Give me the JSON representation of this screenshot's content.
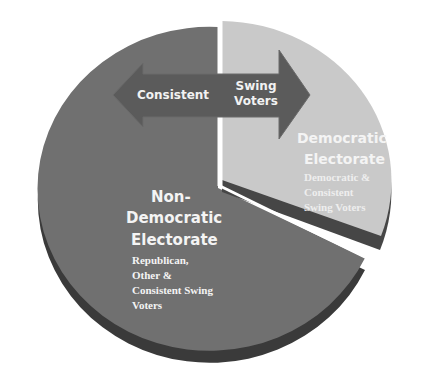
{
  "diagram": {
    "type": "exploded-pie-3d",
    "colors": {
      "non_democratic_face": "#6f6f6f",
      "non_democratic_rim": "#3a3a3a",
      "democratic_face": "#c8c8c8",
      "democratic_rim": "#464646",
      "arrow_fill": "#5a5a5a",
      "label_text": "#f4f4f4",
      "background": "#ffffff"
    },
    "arrow": {
      "left_label": "Consistent",
      "right_label_line1": "Swing",
      "right_label_line2": "Voters"
    },
    "segments": [
      {
        "id": "non-democratic",
        "title_line1": "Non-",
        "title_line2": "Democratic",
        "title_line3": "Electorate",
        "desc_line1": "Republican,",
        "desc_line2": "Other &",
        "desc_line3": "Consistent Swing",
        "desc_line4": "Voters",
        "approx_share": 0.68
      },
      {
        "id": "democratic",
        "title_line1": "Democratic",
        "title_line2": "Electorate",
        "desc_line1": "Democratic &",
        "desc_line2": "Consistent",
        "desc_line3": "Swing Voters",
        "approx_share": 0.32
      }
    ]
  }
}
